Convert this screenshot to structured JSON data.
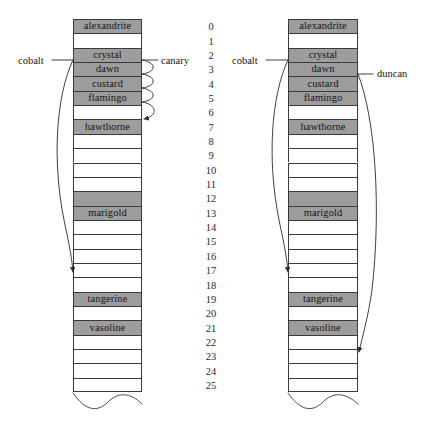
{
  "diagram": {
    "colors": {
      "filled_cell": "#9d9d9d",
      "empty_cell": "#ffffff",
      "stroke": "#3a3a3a",
      "text": "#151515"
    },
    "row_count": 26,
    "indices": [
      "0",
      "1",
      "2",
      "3",
      "4",
      "5",
      "6",
      "7",
      "8",
      "9",
      "10",
      "11",
      "12",
      "13",
      "14",
      "15",
      "16",
      "17",
      "18",
      "19",
      "20",
      "21",
      "22",
      "23",
      "24",
      "25"
    ],
    "tables": [
      {
        "id": "left-table",
        "name": "linear-probing-table",
        "cells": [
          {
            "index": 0,
            "label": "alexandrite",
            "filled": true
          },
          {
            "index": 1,
            "label": "",
            "filled": false
          },
          {
            "index": 2,
            "label": "crystal",
            "filled": true
          },
          {
            "index": 3,
            "label": "dawn",
            "filled": true
          },
          {
            "index": 4,
            "label": "custard",
            "filled": true
          },
          {
            "index": 5,
            "label": "flamingo",
            "filled": true
          },
          {
            "index": 6,
            "label": "",
            "filled": false
          },
          {
            "index": 7,
            "label": "hawthorne",
            "filled": true
          },
          {
            "index": 8,
            "label": "",
            "filled": false
          },
          {
            "index": 9,
            "label": "",
            "filled": false
          },
          {
            "index": 10,
            "label": "",
            "filled": false
          },
          {
            "index": 11,
            "label": "",
            "filled": false
          },
          {
            "index": 12,
            "label": "",
            "filled": true
          },
          {
            "index": 13,
            "label": "marigold",
            "filled": true
          },
          {
            "index": 14,
            "label": "",
            "filled": false
          },
          {
            "index": 15,
            "label": "",
            "filled": false
          },
          {
            "index": 16,
            "label": "",
            "filled": false
          },
          {
            "index": 17,
            "label": "",
            "filled": false
          },
          {
            "index": 18,
            "label": "",
            "filled": false
          },
          {
            "index": 19,
            "label": "tangerine",
            "filled": true
          },
          {
            "index": 20,
            "label": "",
            "filled": false
          },
          {
            "index": 21,
            "label": "vasoline",
            "filled": true
          },
          {
            "index": 22,
            "label": "",
            "filled": false
          },
          {
            "index": 23,
            "label": "",
            "filled": false
          },
          {
            "index": 24,
            "label": "",
            "filled": false
          },
          {
            "index": 25,
            "label": "",
            "filled": false
          }
        ],
        "annotations": [
          {
            "name": "cobalt-label",
            "text": "cobalt",
            "side": "left",
            "from_index": 2,
            "to_index": 17,
            "style": "long-curve-arrow"
          },
          {
            "name": "canary-label",
            "text": "canary",
            "side": "right",
            "from_index": 2,
            "to_index": 6,
            "style": "probe-arcs"
          }
        ]
      },
      {
        "id": "right-table",
        "name": "quadratic-probing-table",
        "cells": [
          {
            "index": 0,
            "label": "alexandrite",
            "filled": true
          },
          {
            "index": 1,
            "label": "",
            "filled": false
          },
          {
            "index": 2,
            "label": "crystal",
            "filled": true
          },
          {
            "index": 3,
            "label": "dawn",
            "filled": true
          },
          {
            "index": 4,
            "label": "custard",
            "filled": true
          },
          {
            "index": 5,
            "label": "flamingo",
            "filled": true
          },
          {
            "index": 6,
            "label": "",
            "filled": false
          },
          {
            "index": 7,
            "label": "hawthorne",
            "filled": true
          },
          {
            "index": 8,
            "label": "",
            "filled": false
          },
          {
            "index": 9,
            "label": "",
            "filled": false
          },
          {
            "index": 10,
            "label": "",
            "filled": false
          },
          {
            "index": 11,
            "label": "",
            "filled": false
          },
          {
            "index": 12,
            "label": "",
            "filled": true
          },
          {
            "index": 13,
            "label": "marigold",
            "filled": true
          },
          {
            "index": 14,
            "label": "",
            "filled": false
          },
          {
            "index": 15,
            "label": "",
            "filled": false
          },
          {
            "index": 16,
            "label": "",
            "filled": false
          },
          {
            "index": 17,
            "label": "",
            "filled": false
          },
          {
            "index": 18,
            "label": "",
            "filled": false
          },
          {
            "index": 19,
            "label": "tangerine",
            "filled": true
          },
          {
            "index": 20,
            "label": "",
            "filled": false
          },
          {
            "index": 21,
            "label": "vasoline",
            "filled": true
          },
          {
            "index": 22,
            "label": "",
            "filled": false
          },
          {
            "index": 23,
            "label": "",
            "filled": false
          },
          {
            "index": 24,
            "label": "",
            "filled": false
          },
          {
            "index": 25,
            "label": "",
            "filled": false
          }
        ],
        "annotations": [
          {
            "name": "cobalt-label",
            "text": "cobalt",
            "side": "left",
            "from_index": 2,
            "to_index": 17,
            "style": "long-curve-arrow"
          },
          {
            "name": "duncan-label",
            "text": "duncan",
            "side": "right",
            "from_index": 3,
            "to_index": 23,
            "style": "long-curve-arrow"
          }
        ]
      }
    ]
  }
}
